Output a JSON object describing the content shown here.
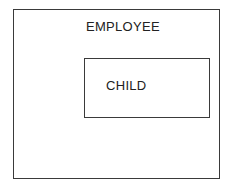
{
  "diagram": {
    "type": "nested-entity-boxes",
    "outer_entity": {
      "label": "EMPLOYEE"
    },
    "inner_entity": {
      "label": "CHILD"
    },
    "colors": {
      "border": "#3a3a3a",
      "text": "#222222",
      "background": "#ffffff"
    }
  }
}
